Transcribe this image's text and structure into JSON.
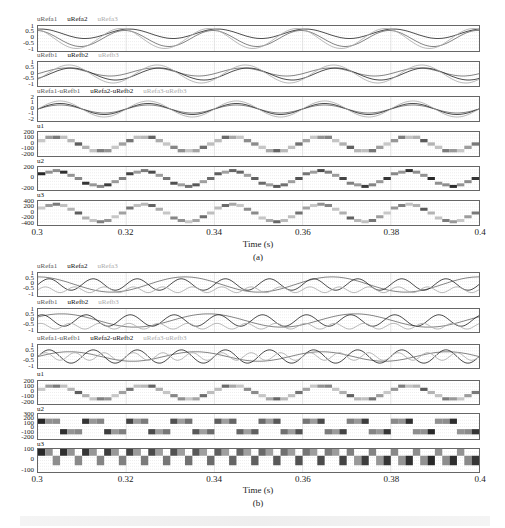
{
  "chart_data": [
    {
      "label": "(a)",
      "type": "line",
      "xlabel": "Time (s)",
      "xlim": [
        0.3,
        0.4
      ],
      "x_ticks": [
        "0.3",
        "0.32",
        "0.34",
        "0.36",
        "0.38",
        "0.4"
      ],
      "grid": true,
      "subplots": [
        {
          "title_series": [
            "uRefa1",
            "uRefa2",
            "uRefa3"
          ],
          "yticks": [
            "1",
            "0.5",
            "0",
            "-0.5",
            "-1"
          ],
          "ylim": [
            -1,
            1
          ],
          "description": "three phase-shifted sinusoidal references, period ~0.02 s"
        },
        {
          "title_series": [
            "uRefb1",
            "uRefb2",
            "uRefb3"
          ],
          "yticks": [
            "1",
            "0.5",
            "0",
            "-0.5",
            "-1"
          ],
          "ylim": [
            -1,
            1
          ]
        },
        {
          "title_series": [
            "uRefa1-uRefb1",
            "uRefa2-uRefb2",
            "uRefa3-uRefb3"
          ],
          "yticks": [
            "2",
            "1",
            "0",
            "-1",
            "-2"
          ],
          "ylim": [
            -2,
            2
          ]
        },
        {
          "title_series": [
            "u1"
          ],
          "yticks": [
            "200",
            "100",
            "0",
            "-100",
            "-200"
          ],
          "ylim": [
            -200,
            200
          ],
          "description": "multilevel PWM stepped waveform"
        },
        {
          "title_series": [
            "u2"
          ],
          "yticks": [
            "200",
            "0",
            "-200"
          ],
          "ylim": [
            -300,
            300
          ]
        },
        {
          "title_series": [
            "u3"
          ],
          "yticks": [
            "400",
            "200",
            "0",
            "-200",
            "-400"
          ],
          "ylim": [
            -400,
            400
          ]
        }
      ]
    },
    {
      "label": "(b)",
      "type": "line",
      "xlabel": "Time (s)",
      "xlim": [
        0.3,
        0.4
      ],
      "x_ticks": [
        "0.3",
        "0.32",
        "0.34",
        "0.36",
        "0.38",
        "0.4"
      ],
      "grid": true,
      "subplots": [
        {
          "title_series": [
            "uRefa1",
            "uRefa2",
            "uRefa3"
          ],
          "yticks": [
            "1",
            "0.5",
            "0",
            "-0.5",
            "-1"
          ],
          "ylim": [
            -1,
            1
          ],
          "description": "references with different frequencies (1x, 2x, 3x)"
        },
        {
          "title_series": [
            "uRefb1",
            "uRefb2",
            "uRefb3"
          ],
          "yticks": [
            "1",
            "0.5",
            "0",
            "-0.5",
            "-1"
          ],
          "ylim": [
            -1,
            1
          ]
        },
        {
          "title_series": [
            "uRefa1-uRefb1",
            "uRefa2-uRefb2",
            "uRefa3-uRefb3"
          ],
          "yticks": [
            "1",
            "0.5",
            "0",
            "-0.5",
            "-1"
          ],
          "ylim": [
            -1,
            1
          ]
        },
        {
          "title_series": [
            "u1"
          ],
          "yticks": [
            "200",
            "100",
            "0",
            "-100",
            "-200"
          ],
          "ylim": [
            -200,
            200
          ]
        },
        {
          "title_series": [
            "u2"
          ],
          "yticks": [
            "300",
            "200",
            "100",
            "0",
            "-100",
            "-200"
          ],
          "ylim": [
            -250,
            300
          ]
        },
        {
          "title_series": [
            "u3"
          ],
          "yticks": [
            "100",
            "0",
            "-100"
          ],
          "ylim": [
            -150,
            150
          ]
        }
      ]
    }
  ],
  "figure": {
    "a": {
      "label": "(a)",
      "xlabel": "Time (s)",
      "x_ticks": [
        "0.3",
        "0.32",
        "0.34",
        "0.36",
        "0.38",
        "0.4"
      ],
      "p0": {
        "s0": "uRefa1",
        "s1": "uRefa2",
        "s2": "uRefa3",
        "y": [
          "1",
          "0.5",
          "0",
          "-0.5",
          "-1"
        ]
      },
      "p1": {
        "s0": "uRefb1",
        "s1": "uRefb2",
        "s2": "uRefb3",
        "y": [
          "1",
          "0.5",
          "0",
          "-0.5",
          "-1"
        ]
      },
      "p2": {
        "s0": "uRefa1-uRefb1",
        "s1": "uRefa2-uRefb2",
        "s2": "uRefa3-uRefb3",
        "y": [
          "2",
          "1",
          "0",
          "-1",
          "-2"
        ]
      },
      "p3": {
        "s0": "u1",
        "y": [
          "200",
          "100",
          "0",
          "-100",
          "-200"
        ]
      },
      "p4": {
        "s0": "u2",
        "y": [
          "200",
          "0",
          "-200"
        ]
      },
      "p5": {
        "s0": "u3",
        "y": [
          "400",
          "200",
          "0",
          "-200",
          "-400"
        ]
      }
    },
    "b": {
      "label": "(b)",
      "xlabel": "Time (s)",
      "x_ticks": [
        "0.3",
        "0.32",
        "0.34",
        "0.36",
        "0.38",
        "0.4"
      ],
      "p0": {
        "s0": "uRefa1",
        "s1": "uRefa2",
        "s2": "uRefa3",
        "y": [
          "1",
          "0.5",
          "0",
          "-0.5",
          "-1"
        ]
      },
      "p1": {
        "s0": "uRefb1",
        "s1": "uRefb2",
        "s2": "uRefb3",
        "y": [
          "1",
          "0.5",
          "0",
          "-0.5",
          "-1"
        ]
      },
      "p2": {
        "s0": "uRefa1-uRefb1",
        "s1": "uRefa2-uRefb2",
        "s2": "uRefa3-uRefb3",
        "y": [
          "1",
          "0.5",
          "0",
          "-0.5",
          "-1"
        ]
      },
      "p3": {
        "s0": "u1",
        "y": [
          "200",
          "100",
          "0",
          "-100",
          "-200"
        ]
      },
      "p4": {
        "s0": "u2",
        "y": [
          "300",
          "200",
          "100",
          "0",
          "-100",
          "-200"
        ]
      },
      "p5": {
        "s0": "u3",
        "y": [
          "100",
          "0",
          "-100"
        ]
      }
    }
  }
}
